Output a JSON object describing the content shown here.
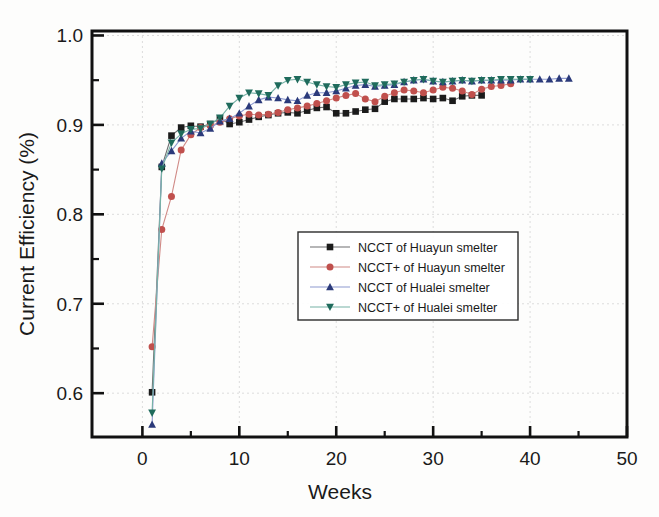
{
  "chart_data": {
    "type": "line",
    "title": "",
    "xlabel": "Weeks",
    "ylabel": "Current Efficiency (%)",
    "xlim": [
      -5.2,
      50.0
    ],
    "ylim": [
      0.551,
      1.005
    ],
    "xticks": [
      0,
      10,
      20,
      30,
      40,
      50
    ],
    "xtick_labels": [
      "0",
      "10",
      "20",
      "30",
      "40",
      "50"
    ],
    "yticks": [
      0.6,
      0.7,
      0.8,
      0.9,
      1.0
    ],
    "ytick_labels": [
      "0.6",
      "0.7",
      "0.8",
      "0.9",
      "1.0"
    ],
    "yticks_minor": [
      0.65,
      0.75,
      0.85,
      0.95
    ],
    "grid": "dotted-light",
    "legend_position": "center",
    "series": [
      {
        "name": "NCCT  of Huayun smelter",
        "color": "#1b1b1b",
        "marker": "square",
        "line_color": "#6e6e70",
        "x": [
          1,
          2,
          3,
          4,
          5,
          6,
          7,
          8,
          9,
          10,
          11,
          12,
          13,
          14,
          15,
          16,
          17,
          18,
          19,
          20,
          21,
          22,
          23,
          24,
          25,
          26,
          27,
          28,
          29,
          30,
          31,
          32,
          33,
          34,
          35
        ],
        "y": [
          0.601,
          0.853,
          0.888,
          0.897,
          0.899,
          0.898,
          0.901,
          0.907,
          0.901,
          0.903,
          0.906,
          0.909,
          0.911,
          0.913,
          0.914,
          0.913,
          0.916,
          0.919,
          0.92,
          0.913,
          0.913,
          0.915,
          0.917,
          0.918,
          0.926,
          0.929,
          0.929,
          0.929,
          0.93,
          0.929,
          0.93,
          0.927,
          0.932,
          0.933,
          0.933
        ]
      },
      {
        "name": "NCCT+ of Huayun smelter",
        "color": "#c0504d",
        "marker": "circle",
        "line_color": "#d08a86",
        "x": [
          1,
          2,
          3,
          4,
          5,
          6,
          7,
          8,
          9,
          10,
          11,
          12,
          13,
          14,
          15,
          16,
          17,
          18,
          19,
          20,
          21,
          22,
          23,
          24,
          25,
          26,
          27,
          28,
          29,
          30,
          31,
          32,
          33,
          34,
          35,
          36,
          37,
          38
        ],
        "y": [
          0.652,
          0.783,
          0.82,
          0.872,
          0.889,
          0.897,
          0.899,
          0.903,
          0.907,
          0.91,
          0.912,
          0.911,
          0.912,
          0.914,
          0.917,
          0.919,
          0.921,
          0.924,
          0.927,
          0.93,
          0.933,
          0.935,
          0.929,
          0.926,
          0.932,
          0.936,
          0.939,
          0.938,
          0.936,
          0.939,
          0.942,
          0.941,
          0.938,
          0.934,
          0.94,
          0.943,
          0.944,
          0.946
        ]
      },
      {
        "name": "NCCT  of Hualei smelter",
        "color": "#2b3a7a",
        "marker": "triangle-up",
        "line_color": "#8e9ad0",
        "x": [
          1,
          2,
          3,
          4,
          5,
          6,
          7,
          8,
          9,
          10,
          11,
          12,
          13,
          14,
          15,
          16,
          17,
          18,
          19,
          20,
          21,
          22,
          23,
          24,
          25,
          26,
          27,
          28,
          29,
          30,
          31,
          32,
          33,
          34,
          35,
          36,
          37,
          38,
          39,
          40,
          41,
          42,
          43,
          44
        ],
        "y": [
          0.565,
          0.857,
          0.871,
          0.885,
          0.893,
          0.891,
          0.896,
          0.904,
          0.907,
          0.913,
          0.921,
          0.928,
          0.931,
          0.93,
          0.928,
          0.927,
          0.933,
          0.936,
          0.936,
          0.938,
          0.941,
          0.944,
          0.945,
          0.943,
          0.944,
          0.945,
          0.948,
          0.95,
          0.951,
          0.949,
          0.948,
          0.949,
          0.95,
          0.949,
          0.95,
          0.95,
          0.95,
          0.95,
          0.951,
          0.951,
          0.951,
          0.951,
          0.952,
          0.952
        ]
      },
      {
        "name": "NCCT+ of Hualei smelter",
        "color": "#1f6b5c",
        "marker": "triangle-down",
        "line_color": "#76b2a6",
        "x": [
          1,
          2,
          3,
          4,
          5,
          6,
          7,
          8,
          9,
          10,
          11,
          12,
          13,
          14,
          15,
          16,
          17,
          18,
          19,
          20,
          21,
          22,
          23,
          24,
          25,
          26,
          27,
          28,
          29,
          30,
          31,
          32,
          33,
          34,
          35,
          36,
          37,
          38,
          39,
          40
        ],
        "y": [
          0.578,
          0.851,
          0.88,
          0.89,
          0.895,
          0.896,
          0.901,
          0.908,
          0.921,
          0.93,
          0.936,
          0.935,
          0.933,
          0.944,
          0.95,
          0.951,
          0.948,
          0.945,
          0.943,
          0.942,
          0.945,
          0.947,
          0.948,
          0.944,
          0.945,
          0.946,
          0.948,
          0.95,
          0.951,
          0.949,
          0.948,
          0.949,
          0.95,
          0.949,
          0.95,
          0.95,
          0.951,
          0.951,
          0.951,
          0.951
        ]
      }
    ]
  },
  "legend": {
    "entries": [
      {
        "label": "NCCT  of Huayun smelter"
      },
      {
        "label": "NCCT+ of Huayun smelter"
      },
      {
        "label": "NCCT  of Hualei smelter"
      },
      {
        "label": "NCCT+ of Hualei smelter"
      }
    ]
  },
  "axes": {
    "x_title": "Weeks",
    "y_title": "Current Efficiency (%)"
  }
}
